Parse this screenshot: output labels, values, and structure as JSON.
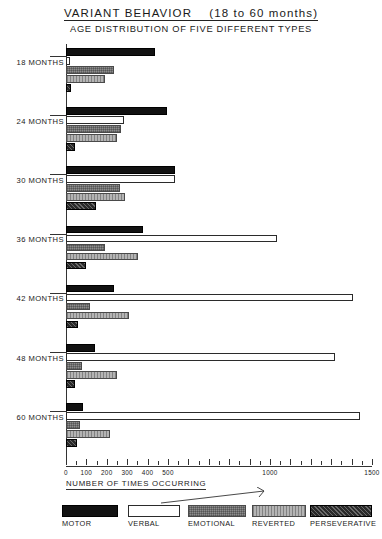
{
  "titles": {
    "main_left": "VARIANT BEHAVIOR",
    "main_right": "(18 to 60 months)",
    "subtitle": "AGE DISTRIBUTION OF FIVE DIFFERENT TYPES"
  },
  "axis": {
    "title": "NUMBER OF TIMES OCCURRING",
    "tick_labels": [
      "0",
      "100",
      "200",
      "300",
      "400",
      "500",
      "1000",
      "1500"
    ],
    "tick_values": [
      0,
      100,
      200,
      300,
      400,
      500,
      1000,
      1500
    ]
  },
  "legend": {
    "items": [
      {
        "label": "MOTOR",
        "key": "motor",
        "swatch": "black-solid"
      },
      {
        "label": "VERBAL",
        "key": "verbal",
        "swatch": "white-outline"
      },
      {
        "label": "EMOTIONAL",
        "key": "emotional",
        "swatch": "medium-gray-stipple"
      },
      {
        "label": "REVERTED",
        "key": "reverted",
        "swatch": "light-gray-vertical-lines"
      },
      {
        "label": "PERSEVERATIVE",
        "key": "perseverative",
        "swatch": "dark-hatched"
      }
    ]
  },
  "chart_data": {
    "type": "bar",
    "orientation": "horizontal",
    "subtitle": "AGE DISTRIBUTION OF FIVE DIFFERENT TYPES",
    "xlabel": "NUMBER OF TIMES OCCURRING",
    "ylabel": "",
    "xlim": [
      0,
      1500
    ],
    "grid": false,
    "legend_position": "bottom",
    "categories": [
      "18 MONTHS",
      "24 MONTHS",
      "30 MONTHS",
      "36 MONTHS",
      "42 MONTHS",
      "48 MONTHS",
      "60 MONTHS"
    ],
    "series": [
      {
        "name": "MOTOR",
        "values": [
          435,
          495,
          535,
          375,
          235,
          140,
          85
        ]
      },
      {
        "name": "VERBAL",
        "values": [
          20,
          285,
          535,
          1035,
          1405,
          1320,
          1440
        ]
      },
      {
        "name": "EMOTIONAL",
        "values": [
          235,
          270,
          265,
          190,
          120,
          80,
          70
        ]
      },
      {
        "name": "REVERTED",
        "values": [
          190,
          250,
          290,
          355,
          310,
          250,
          215
        ]
      },
      {
        "name": "PERSEVERATIVE",
        "values": [
          25,
          45,
          145,
          100,
          60,
          45,
          55
        ]
      }
    ]
  }
}
